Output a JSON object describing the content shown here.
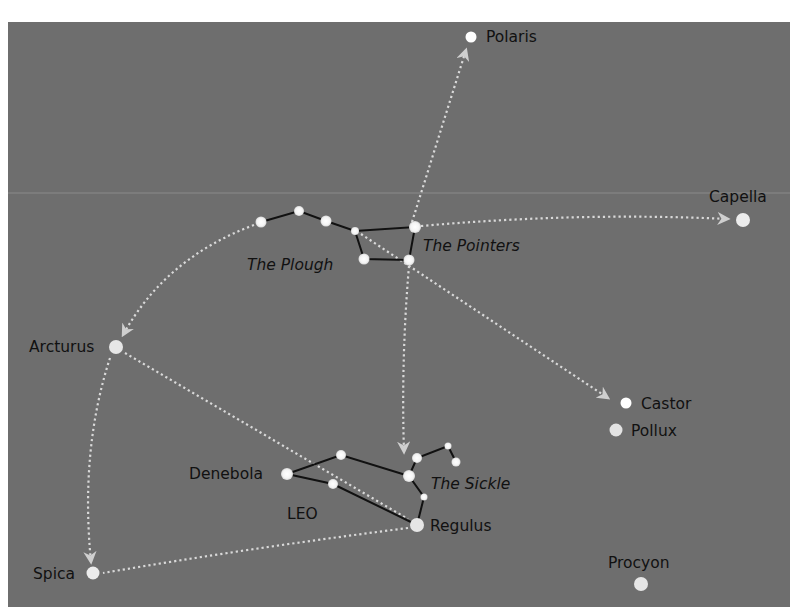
{
  "diagram": {
    "title": "",
    "colors": {
      "background": "#6e6e6e",
      "frame_outer": "#ffffff",
      "horizon_line": "#8a8a8a",
      "star_fill": "#ffffff",
      "bright_star_fill": "#e6e6e6",
      "constellation_line": "#111111",
      "pointer_line": "#d9d9d9",
      "label_text": "#111111"
    },
    "labels": {
      "polaris": "Polaris",
      "capella": "Capella",
      "the_pointers": "The Pointers",
      "the_plough": "The Plough",
      "arcturus": "Arcturus",
      "castor": "Castor",
      "pollux": "Pollux",
      "denebola": "Denebola",
      "the_sickle": "The Sickle",
      "leo": "LEO",
      "regulus": "Regulus",
      "spica": "Spica",
      "procyon": "Procyon"
    },
    "bright_stars": [
      {
        "name": "Polaris",
        "x": 471,
        "y": 37,
        "r": 5.5
      },
      {
        "name": "Capella",
        "x": 743,
        "y": 220,
        "r": 7
      },
      {
        "name": "Arcturus",
        "x": 116,
        "y": 347,
        "r": 7
      },
      {
        "name": "Castor",
        "x": 626,
        "y": 403,
        "r": 5.5
      },
      {
        "name": "Pollux",
        "x": 616,
        "y": 430,
        "r": 6.5
      },
      {
        "name": "Spica",
        "x": 93,
        "y": 573,
        "r": 6.5
      },
      {
        "name": "Procyon",
        "x": 641,
        "y": 584,
        "r": 7
      },
      {
        "name": "Regulus",
        "x": 417,
        "y": 525,
        "r": 7
      }
    ],
    "constellations": [
      {
        "name": "The Plough",
        "stars": [
          [
            261,
            222
          ],
          [
            299,
            211
          ],
          [
            326,
            221
          ],
          [
            355,
            231
          ],
          [
            415,
            227
          ],
          [
            409,
            260
          ],
          [
            364,
            259
          ]
        ],
        "lines": [
          [
            0,
            1
          ],
          [
            1,
            2
          ],
          [
            2,
            3
          ],
          [
            3,
            4
          ],
          [
            4,
            5
          ],
          [
            5,
            6
          ],
          [
            6,
            3
          ]
        ]
      },
      {
        "name": "Leo",
        "stars": [
          [
            287,
            474
          ],
          [
            341,
            455
          ],
          [
            333,
            484
          ],
          [
            409,
            476
          ],
          [
            417,
            458
          ],
          [
            448,
            446
          ],
          [
            456,
            462
          ],
          [
            424,
            497
          ],
          [
            417,
            525
          ]
        ],
        "lines": [
          [
            0,
            1
          ],
          [
            1,
            3
          ],
          [
            0,
            2
          ],
          [
            2,
            8
          ],
          [
            3,
            4
          ],
          [
            4,
            5
          ],
          [
            5,
            6
          ],
          [
            3,
            7
          ],
          [
            7,
            8
          ]
        ]
      }
    ],
    "pointer_paths": [
      {
        "from": "The Pointers",
        "to": "Polaris",
        "arrow": true
      },
      {
        "from": "The Pointers",
        "to": "Capella",
        "arrow": true
      },
      {
        "from": "The Plough",
        "to": "Arcturus",
        "arrow": true
      },
      {
        "from": "The Plough",
        "to": "Castor",
        "arrow": true
      },
      {
        "from": "The Pointers",
        "to": "Leo",
        "arrow": true
      },
      {
        "from": "Arcturus",
        "to": "Spica",
        "arrow": true
      },
      {
        "from": "Arcturus",
        "to": "Regulus",
        "arrow": false
      },
      {
        "from": "Regulus",
        "to": "Spica",
        "arrow": false
      }
    ]
  }
}
